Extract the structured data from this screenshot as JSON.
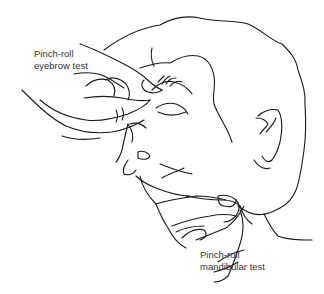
{
  "figure": {
    "labels": {
      "eyebrow": {
        "line1": "Pinch-roll",
        "line2": "eyebrow test"
      },
      "mandibular": {
        "line1": "Pinch-roll",
        "line2": "mandibular test"
      }
    },
    "colors": {
      "stroke": "#1a1a1a",
      "text": "#333333",
      "background": "#ffffff"
    }
  }
}
